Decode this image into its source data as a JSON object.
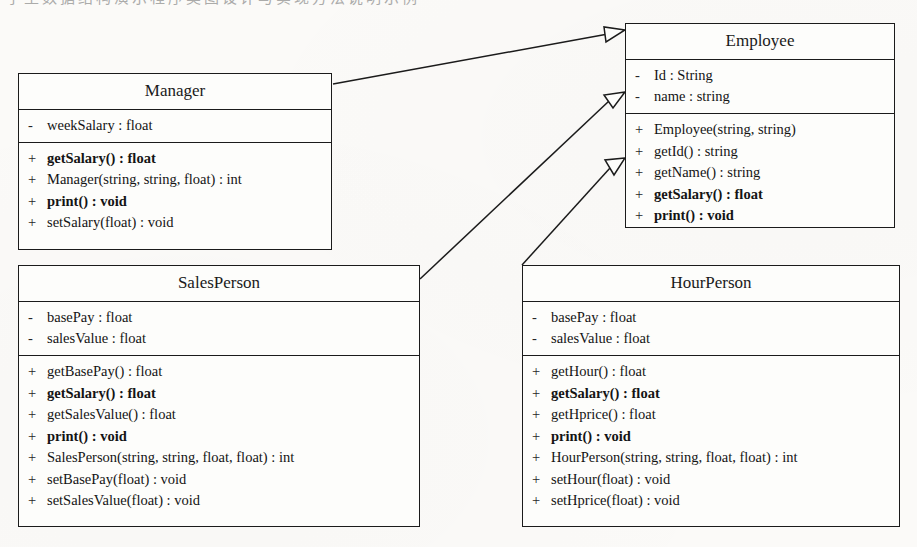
{
  "page": {
    "top_clipped_text": "学生数据结构演示程序类图设计与实现方法说明示例",
    "background_color": "#fbfaf8",
    "line_color": "#1b1b1b"
  },
  "classes": [
    {
      "id": "manager",
      "name": "Manager",
      "attributes": [
        {
          "visibility": "-",
          "signature": "weekSalary : float",
          "bold": false
        }
      ],
      "methods": [
        {
          "visibility": "+",
          "signature": "getSalary() : float",
          "bold": true
        },
        {
          "visibility": "+",
          "signature": "Manager(string, string, float) : int",
          "bold": false
        },
        {
          "visibility": "+",
          "signature": "print() : void",
          "bold": true
        },
        {
          "visibility": "+",
          "signature": "setSalary(float) : void",
          "bold": false
        }
      ]
    },
    {
      "id": "employee",
      "name": "Employee",
      "attributes": [
        {
          "visibility": "-",
          "signature": "Id : String",
          "bold": false
        },
        {
          "visibility": "-",
          "signature": "name : string",
          "bold": false
        }
      ],
      "methods": [
        {
          "visibility": "+",
          "signature": "Employee(string, string)",
          "bold": false
        },
        {
          "visibility": "+",
          "signature": "getId() : string",
          "bold": false
        },
        {
          "visibility": "+",
          "signature": "getName() : string",
          "bold": false
        },
        {
          "visibility": "+",
          "signature": "getSalary() : float",
          "bold": true
        },
        {
          "visibility": "+",
          "signature": "print() : void",
          "bold": true
        }
      ]
    },
    {
      "id": "salesperson",
      "name": "SalesPerson",
      "attributes": [
        {
          "visibility": "-",
          "signature": "basePay : float",
          "bold": false
        },
        {
          "visibility": "-",
          "signature": "salesValue : float",
          "bold": false
        }
      ],
      "methods": [
        {
          "visibility": "+",
          "signature": "getBasePay() : float",
          "bold": false
        },
        {
          "visibility": "+",
          "signature": "getSalary() : float",
          "bold": true
        },
        {
          "visibility": "+",
          "signature": "getSalesValue() : float",
          "bold": false
        },
        {
          "visibility": "+",
          "signature": "print() : void",
          "bold": true
        },
        {
          "visibility": "+",
          "signature": "SalesPerson(string, string, float, float) : int",
          "bold": false
        },
        {
          "visibility": "+",
          "signature": "setBasePay(float) : void",
          "bold": false
        },
        {
          "visibility": "+",
          "signature": "setSalesValue(float) : void",
          "bold": false
        }
      ]
    },
    {
      "id": "hourperson",
      "name": "HourPerson",
      "attributes": [
        {
          "visibility": "-",
          "signature": "basePay : float",
          "bold": false
        },
        {
          "visibility": "-",
          "signature": "salesValue : float",
          "bold": false
        }
      ],
      "methods": [
        {
          "visibility": "+",
          "signature": "getHour() : float",
          "bold": false
        },
        {
          "visibility": "+",
          "signature": "getSalary() : float",
          "bold": true
        },
        {
          "visibility": "+",
          "signature": "getHprice() : float",
          "bold": false
        },
        {
          "visibility": "+",
          "signature": "print() : void",
          "bold": true
        },
        {
          "visibility": "+",
          "signature": "HourPerson(string, string, float, float) : int",
          "bold": false
        },
        {
          "visibility": "+",
          "signature": "setHour(float) : void",
          "bold": false
        },
        {
          "visibility": "+",
          "signature": "setHprice(float) : void",
          "bold": false
        }
      ]
    }
  ],
  "relationships": [
    {
      "id": "manager-to-employee",
      "type": "generalization",
      "from": "Manager",
      "to": "Employee"
    },
    {
      "id": "salesperson-to-employee",
      "type": "generalization",
      "from": "SalesPerson",
      "to": "Employee"
    },
    {
      "id": "hourperson-to-employee",
      "type": "generalization",
      "from": "HourPerson",
      "to": "Employee"
    }
  ]
}
